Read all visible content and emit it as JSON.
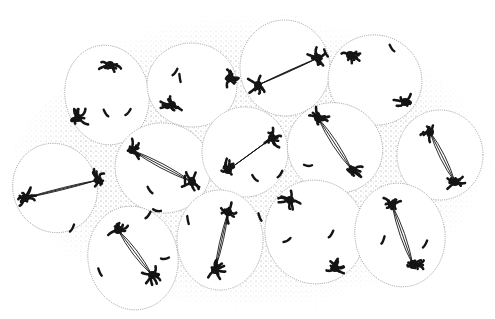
{
  "figure": {
    "colors": {
      "background": "#ffffff",
      "stipple": "#9a9a9a",
      "cell_fill": "#ffffff",
      "cell_border": "#8a8a8a",
      "chromatin": "#141414"
    },
    "cells": [
      {
        "cx": 107,
        "cy": 95,
        "rx": 42,
        "ry": 50,
        "rot": -10,
        "a": [
          110,
          65
        ],
        "b": [
          78,
          118
        ],
        "spindle": false
      },
      {
        "cx": 192,
        "cy": 85,
        "rx": 45,
        "ry": 42,
        "rot": 5,
        "a": [
          230,
          78
        ],
        "b": [
          172,
          105
        ],
        "spindle": false
      },
      {
        "cx": 285,
        "cy": 68,
        "rx": 45,
        "ry": 48,
        "rot": -5,
        "a": [
          318,
          58
        ],
        "b": [
          258,
          85
        ],
        "spindle": true
      },
      {
        "cx": 375,
        "cy": 80,
        "rx": 47,
        "ry": 45,
        "rot": 15,
        "a": [
          350,
          55
        ],
        "b": [
          405,
          102
        ],
        "spindle": false
      },
      {
        "cx": 440,
        "cy": 155,
        "rx": 43,
        "ry": 45,
        "rot": 0,
        "a": [
          430,
          132
        ],
        "b": [
          455,
          182
        ],
        "spindle": true
      },
      {
        "cx": 55,
        "cy": 188,
        "rx": 42,
        "ry": 45,
        "rot": -20,
        "a": [
          98,
          180
        ],
        "b": [
          25,
          198
        ],
        "spindle": true
      },
      {
        "cx": 163,
        "cy": 168,
        "rx": 48,
        "ry": 45,
        "rot": 10,
        "a": [
          132,
          150
        ],
        "b": [
          192,
          182
        ],
        "spindle": true
      },
      {
        "cx": 245,
        "cy": 152,
        "rx": 43,
        "ry": 45,
        "rot": 0,
        "a": [
          272,
          138
        ],
        "b": [
          228,
          170
        ],
        "spindle": true
      },
      {
        "cx": 335,
        "cy": 148,
        "rx": 48,
        "ry": 45,
        "rot": 20,
        "a": [
          318,
          118
        ],
        "b": [
          352,
          170
        ],
        "spindle": true
      },
      {
        "cx": 133,
        "cy": 258,
        "rx": 45,
        "ry": 52,
        "rot": -10,
        "a": [
          118,
          230
        ],
        "b": [
          152,
          275
        ],
        "spindle": true
      },
      {
        "cx": 220,
        "cy": 240,
        "rx": 43,
        "ry": 50,
        "rot": 0,
        "a": [
          228,
          212
        ],
        "b": [
          215,
          270
        ],
        "spindle": true
      },
      {
        "cx": 315,
        "cy": 232,
        "rx": 50,
        "ry": 52,
        "rot": -15,
        "a": [
          290,
          200
        ],
        "b": [
          335,
          268
        ],
        "spindle": false
      },
      {
        "cx": 400,
        "cy": 235,
        "rx": 45,
        "ry": 52,
        "rot": -10,
        "a": [
          392,
          205
        ],
        "b": [
          413,
          265
        ],
        "spindle": true
      }
    ],
    "stray_chromosomes": [
      [
        175,
        72
      ],
      [
        180,
        78
      ],
      [
        128,
        112
      ],
      [
        106,
        113
      ],
      [
        326,
        53
      ],
      [
        392,
        48
      ],
      [
        185,
        180
      ],
      [
        150,
        190
      ],
      [
        157,
        210
      ],
      [
        72,
        228
      ],
      [
        148,
        215
      ],
      [
        188,
        220
      ],
      [
        255,
        178
      ],
      [
        308,
        165
      ],
      [
        287,
        240
      ],
      [
        331,
        234
      ],
      [
        383,
        240
      ],
      [
        425,
        244
      ],
      [
        100,
        272
      ],
      [
        165,
        258
      ],
      [
        260,
        217
      ],
      [
        280,
        174
      ]
    ]
  }
}
